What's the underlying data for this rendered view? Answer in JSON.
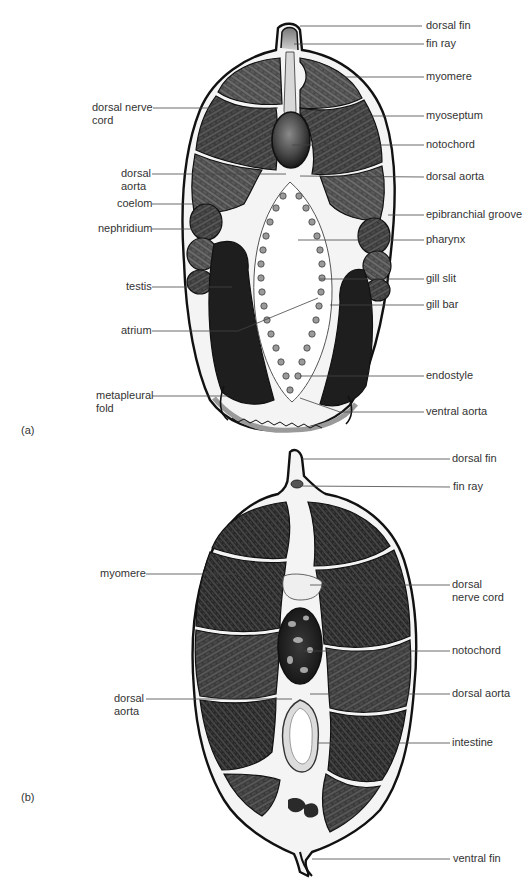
{
  "figure": {
    "panels": [
      {
        "id": "a",
        "tag": "(a)",
        "labels_right": [
          {
            "text": "dorsal fin",
            "y": 26
          },
          {
            "text": "fin ray",
            "y": 44
          },
          {
            "text": "myomere",
            "y": 77
          },
          {
            "text": "myoseptum",
            "y": 116
          },
          {
            "text": "notochord",
            "y": 145
          },
          {
            "text": "dorsal aorta",
            "y": 177
          },
          {
            "text": "epibranchial groove",
            "y": 215
          },
          {
            "text": "pharynx",
            "y": 240
          },
          {
            "text": "gill slit",
            "y": 279
          },
          {
            "text": "gill bar",
            "y": 305
          },
          {
            "text": "endostyle",
            "y": 376
          },
          {
            "text": "ventral aorta",
            "y": 412
          }
        ],
        "labels_left": [
          {
            "text": "dorsal nerve",
            "text2": "cord",
            "y": 108
          },
          {
            "text": "dorsal",
            "text2": "aorta",
            "y": 174
          },
          {
            "text": "coelom",
            "y": 204
          },
          {
            "text": "nephridium",
            "y": 229
          },
          {
            "text": "testis",
            "y": 287
          },
          {
            "text": "atrium",
            "y": 331
          },
          {
            "text": "metapleural",
            "text2": "fold",
            "y": 396
          }
        ]
      },
      {
        "id": "b",
        "tag": "(b)",
        "labels_right": [
          {
            "text": "dorsal fin",
            "y": 459
          },
          {
            "text": "fin ray",
            "y": 487
          },
          {
            "text": "dorsal",
            "text2": "nerve cord",
            "y": 585
          },
          {
            "text": "notochord",
            "y": 651
          },
          {
            "text": "dorsal aorta",
            "y": 694
          },
          {
            "text": "intestine",
            "y": 743
          },
          {
            "text": "ventral fin",
            "y": 859
          }
        ],
        "labels_left": [
          {
            "text": "myomere",
            "y": 574
          },
          {
            "text": "dorsal",
            "text2": "aorta",
            "y": 699
          }
        ]
      }
    ]
  },
  "text": {
    "a_tag": "(a)",
    "b_tag": "(b)",
    "a_r": [
      "dorsal fin",
      "fin ray",
      "myomere",
      "myoseptum",
      "notochord",
      "dorsal aorta",
      "epibranchial groove",
      "pharynx",
      "gill slit",
      "gill bar",
      "endostyle",
      "ventral aorta"
    ],
    "a_l": [
      "dorsal nerve",
      "cord",
      "dorsal",
      "aorta",
      "coelom",
      "nephridium",
      "testis",
      "atrium",
      "metapleural",
      "fold"
    ],
    "b_r": [
      "dorsal fin",
      "fin ray",
      "dorsal",
      "nerve cord",
      "notochord",
      "dorsal aorta",
      "intestine",
      "ventral fin"
    ],
    "b_l": [
      "myomere",
      "dorsal",
      "aorta"
    ]
  },
  "colors": {
    "ink": "#111111",
    "muscle": "#4a4a4a",
    "muscle_dark": "#2a2a2a",
    "gonad": "#1e1e1e",
    "notochord": "#555555",
    "leader": "#444444",
    "label": "#333333"
  }
}
